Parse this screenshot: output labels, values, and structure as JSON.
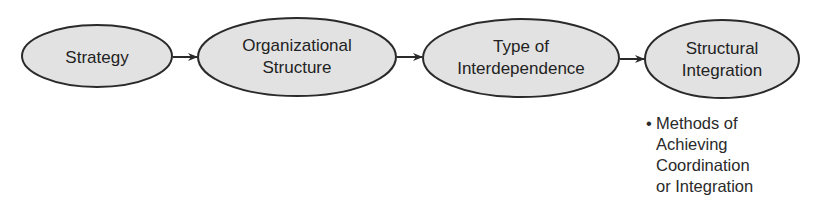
{
  "diagram": {
    "nodes": [
      {
        "id": "strategy",
        "lines": [
          "Strategy"
        ]
      },
      {
        "id": "organizational-structure",
        "lines": [
          "Organizational",
          "Structure"
        ]
      },
      {
        "id": "type-of-interdependence",
        "lines": [
          "Type of",
          "Interdependence"
        ]
      },
      {
        "id": "structural-integration",
        "lines": [
          "Structural",
          "Integration"
        ]
      }
    ],
    "edges": [
      {
        "from": "strategy",
        "to": "organizational-structure"
      },
      {
        "from": "organizational-structure",
        "to": "type-of-interdependence"
      },
      {
        "from": "type-of-interdependence",
        "to": "structural-integration"
      }
    ],
    "note": {
      "bullet": "•",
      "lines": [
        "Methods of",
        "Achieving",
        "Coordination",
        "or Integration"
      ]
    },
    "colors": {
      "node_fill": "#e2e2e2",
      "node_stroke": "#2a2a2a",
      "text": "#222222",
      "arrow": "#2a2a2a"
    }
  }
}
